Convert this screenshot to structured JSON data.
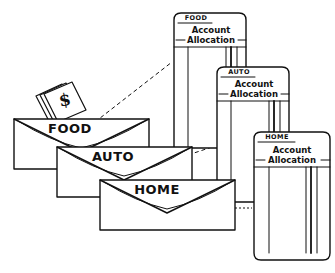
{
  "diagram": {
    "background_color": "#ffffff",
    "ink_color": "#111111",
    "style": "hand-drawn line art"
  },
  "envelopes": [
    {
      "id": "food",
      "label": "FOOD",
      "has_cash": true,
      "cash_symbol": "$",
      "x": 14,
      "y": 117,
      "w": 135,
      "h": 52
    },
    {
      "id": "auto",
      "label": "AUTO",
      "has_cash": false,
      "cash_symbol": "",
      "x": 57,
      "y": 145,
      "w": 135,
      "h": 52
    },
    {
      "id": "home",
      "label": "HOME",
      "has_cash": false,
      "cash_symbol": "",
      "x": 100,
      "y": 178,
      "w": 135,
      "h": 52
    }
  ],
  "cards": [
    {
      "id": "food-card",
      "tab_label": "FOOD",
      "title_line1": "Account",
      "title_line2": "Allocation",
      "x": 172,
      "y": 12,
      "w": 74,
      "h": 136
    },
    {
      "id": "auto-card",
      "tab_label": "AUTO",
      "title_line1": "Account",
      "title_line2": "Allocation",
      "x": 215,
      "y": 66,
      "w": 74,
      "h": 136
    },
    {
      "id": "home-card",
      "tab_label": "HOME",
      "title_line1": "Account",
      "title_line2": "Allocation",
      "x": 252,
      "y": 131,
      "w": 78,
      "h": 129
    }
  ],
  "connectors": [
    {
      "id": "food-link",
      "from": "food",
      "to": "food-card",
      "style": "dashed"
    },
    {
      "id": "auto-link",
      "from": "auto",
      "to": "auto-card",
      "style": "dashed"
    },
    {
      "id": "home-link",
      "from": "home",
      "to": "home-card",
      "style": "dotted"
    }
  ]
}
